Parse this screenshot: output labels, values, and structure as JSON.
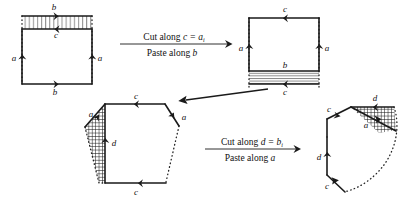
{
  "arrows": [
    {
      "id": "arrow-1",
      "direction": "right",
      "top_line_prefix": "Cut along ",
      "top_line_math": "c = a",
      "top_line_subscript": "i",
      "bottom_line_prefix": "Paste along ",
      "bottom_line_math": "b"
    },
    {
      "id": "arrow-2",
      "direction": "down-left",
      "top_line_prefix": "",
      "top_line_math": "",
      "top_line_subscript": "",
      "bottom_line_prefix": "",
      "bottom_line_math": ""
    },
    {
      "id": "arrow-3",
      "direction": "right",
      "top_line_prefix": "Cut along ",
      "top_line_math": "d = b",
      "top_line_subscript": "i",
      "bottom_line_prefix": "Paste along ",
      "bottom_line_math": "a"
    }
  ],
  "figures": [
    {
      "id": "figure-1",
      "shape": "rectangle-with-top-strip",
      "edge_labels": [
        "b",
        "c",
        "a",
        "a",
        "b"
      ],
      "hatch": "vertical",
      "hatch_position": "top-strip"
    },
    {
      "id": "figure-2",
      "shape": "rectangle-with-bottom-strip",
      "edge_labels": [
        "c",
        "a",
        "a",
        "b",
        "c"
      ],
      "hatch": "horizontal",
      "hatch_position": "bottom-strip"
    },
    {
      "id": "figure-3",
      "shape": "hexagon-with-left-triangle",
      "edge_labels": [
        "c",
        "a",
        "a",
        "d",
        "c"
      ],
      "hatch": "cross",
      "hatch_position": "left-wedge"
    },
    {
      "id": "figure-4",
      "shape": "polygon-with-corner-wedge-and-dotted-arc",
      "edge_labels": [
        "d",
        "c",
        "a",
        "d",
        "c"
      ],
      "hatch": "cross",
      "hatch_position": "top-right-wedge"
    }
  ],
  "colors": {
    "ink": "#1a1a1a",
    "background": "#ffffff",
    "hatch": "#1a1a1a"
  }
}
